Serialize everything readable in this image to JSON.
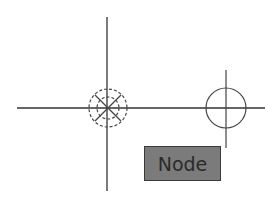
{
  "canvas": {
    "background": "#ffffff",
    "line_color": "#333333",
    "crosshair": {
      "x": 107,
      "y": 108
    },
    "node_marker": {
      "cx": 108,
      "cy": 108,
      "outer_r": 19,
      "inner_r": 11
    },
    "target_marker": {
      "cx": 226,
      "cy": 108,
      "r": 20
    }
  },
  "tooltip": {
    "label": "Node",
    "fill": "#7b7b7b"
  }
}
